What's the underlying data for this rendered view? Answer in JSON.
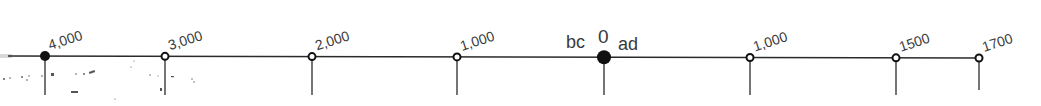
{
  "timeline": {
    "era_labels": {
      "before": "bc",
      "after": "ad"
    },
    "line_color": "#2a2a2a",
    "marks": [
      {
        "label": "4,000",
        "year": -4000,
        "style": "filled"
      },
      {
        "label": "3,000",
        "year": -3000,
        "style": "hollow"
      },
      {
        "label": "2,000",
        "year": -2000,
        "style": "hollow"
      },
      {
        "label": "1,000",
        "year": -1000,
        "style": "hollow"
      },
      {
        "label": "0",
        "year": 0,
        "style": "filled-large"
      },
      {
        "label": "1,000",
        "year": 1000,
        "style": "hollow"
      },
      {
        "label": "1500",
        "year": 1500,
        "style": "hollow"
      },
      {
        "label": "1700",
        "year": 1700,
        "style": "hollow"
      }
    ]
  }
}
